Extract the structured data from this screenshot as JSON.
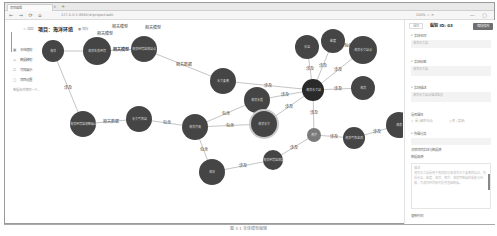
{
  "browser": {
    "tab_label": "项目编辑",
    "tab_close": "×",
    "new_tab": "+",
    "nav_icons": "← → ⟳ ⌂",
    "url": "127.0.0.1:8080/#/project/edit",
    "addr_right": "100%  ☆ ≡",
    "window_icons": "— ▢"
  },
  "header": {
    "back_label": "< 返回",
    "project_title": "项目：海洋环境",
    "badge_label": "● 保存"
  },
  "sidebar": {
    "items": [
      {
        "icon": "▣",
        "label": "本体建模"
      },
      {
        "icon": "⚠",
        "label": "数据映射"
      },
      {
        "icon": "☐",
        "label": "可视展示"
      },
      {
        "icon": "▢",
        "label": "项目设置"
      },
      {
        "icon": "",
        "label": "数据合并等同一个..."
      }
    ]
  },
  "graph": {
    "nodes": [
      {
        "id": "n1",
        "x": 48,
        "y": 31,
        "r": 11,
        "label": "海洋"
      },
      {
        "id": "n2",
        "x": 92,
        "y": 31,
        "r": 14,
        "label": "海洋生态环境"
      },
      {
        "id": "n3",
        "x": 139,
        "y": 29,
        "r": 13,
        "label": "海洋环境监测站点"
      },
      {
        "id": "n4",
        "x": 78,
        "y": 104,
        "r": 13,
        "label": "海洋环境监测数据点"
      },
      {
        "id": "n5",
        "x": 134,
        "y": 99,
        "r": 13,
        "label": "水文气象站"
      },
      {
        "id": "n6",
        "x": 190,
        "y": 107,
        "r": 13,
        "label": "海洋污染"
      },
      {
        "id": "n7",
        "x": 218,
        "y": 61,
        "r": 13,
        "label": "水文要素"
      },
      {
        "id": "n8",
        "x": 252,
        "y": 80,
        "r": 13,
        "label": "海洋水质"
      },
      {
        "id": "n9",
        "x": 259,
        "y": 104,
        "r": 13,
        "label": "海洋水文",
        "highlight": true
      },
      {
        "id": "n10",
        "x": 302,
        "y": 27,
        "r": 12,
        "label": "水温"
      },
      {
        "id": "n11",
        "x": 328,
        "y": 21,
        "r": 12,
        "label": "盐度"
      },
      {
        "id": "n12",
        "x": 308,
        "y": 70,
        "r": 11,
        "label": "海洋水文站"
      },
      {
        "id": "n13",
        "x": 358,
        "y": 30,
        "r": 14,
        "label": "海洋水文站点"
      },
      {
        "id": "n14",
        "x": 358,
        "y": 68,
        "r": 12,
        "label": "海流"
      },
      {
        "id": "n15",
        "x": 309,
        "y": 115,
        "r": 7,
        "label": "潮汐",
        "light": true
      },
      {
        "id": "n16",
        "x": 349,
        "y": 118,
        "r": 11,
        "label": "海洋气象监测"
      },
      {
        "id": "n17",
        "x": 394,
        "y": 105,
        "r": 13,
        "label": "海浪"
      },
      {
        "id": "n18",
        "x": 268,
        "y": 140,
        "r": 10,
        "label": "海洋环境监测站"
      },
      {
        "id": "n19",
        "x": 207,
        "y": 152,
        "r": 13,
        "label": "海冰"
      }
    ],
    "edges": [
      {
        "from": "n1",
        "to": "n2",
        "label": ""
      },
      {
        "from": "n2",
        "to": "n3",
        "label": "相关模型"
      },
      {
        "from": "n2",
        "to": "n3",
        "label": "相关模型"
      },
      {
        "from": "n3",
        "to": "n7",
        "label": "相关数据"
      },
      {
        "from": "n1",
        "to": "n4",
        "label": "涉及"
      },
      {
        "from": "n4",
        "to": "n5",
        "label": "相关数据"
      },
      {
        "from": "n5",
        "to": "n6",
        "label": "包含"
      },
      {
        "from": "n6",
        "to": "n8",
        "label": "包含"
      },
      {
        "from": "n6",
        "to": "n9",
        "label": "包含"
      },
      {
        "from": "n6",
        "to": "n19",
        "label": "包含"
      },
      {
        "from": "n7",
        "to": "n12",
        "label": "涉及"
      },
      {
        "from": "n8",
        "to": "n12",
        "label": "涉及"
      },
      {
        "from": "n9",
        "to": "n12",
        "label": "涉及"
      },
      {
        "from": "n10",
        "to": "n12",
        "label": "涉及"
      },
      {
        "from": "n11",
        "to": "n12",
        "label": "涉及"
      },
      {
        "from": "n11",
        "to": "n13",
        "label": "包含"
      },
      {
        "from": "n13",
        "to": "n12",
        "label": "涉及"
      },
      {
        "from": "n14",
        "to": "n12",
        "label": "涉及"
      },
      {
        "from": "n12",
        "to": "n15",
        "label": "涉及"
      },
      {
        "from": "n15",
        "to": "n16",
        "label": "涉及"
      },
      {
        "from": "n16",
        "to": "n17",
        "label": "涉及"
      },
      {
        "from": "n15",
        "to": "n18",
        "label": "涉及"
      },
      {
        "from": "n18",
        "to": "n19",
        "label": "涉及"
      }
    ],
    "floating_labels": [
      {
        "x": 115,
        "y": 8,
        "text": "相关模型"
      },
      {
        "x": 100,
        "y": 15,
        "text": "相关模型"
      },
      {
        "x": 148,
        "y": 9,
        "text": "相关模型"
      }
    ]
  },
  "panel": {
    "tab_inactive": "属性",
    "tab_active": "编辑 ID: 03",
    "action_button": "保存修改",
    "fields": [
      {
        "label": "* 实体名称",
        "value": "海洋水文站"
      },
      {
        "label": "* 实体标签",
        "value": "海洋水文站"
      },
      {
        "label": "* 实体描述",
        "value": "海洋水文站点描述信息"
      }
    ],
    "radio_label": "是否属性",
    "radio_options": [
      "○ 是 (属性节点)",
      "○ 否 (实体)"
    ],
    "extra_label": "* 所属分类",
    "extra_value": "",
    "link_text": "关联项目实体与数据源",
    "section_label": "数据来源",
    "desc_title": "描述",
    "desc_text": "海洋水文站是用于观测和记录海洋水文要素的站点，包括水温、盐度、海流、潮汐、海浪等数据的采集与传输，为海洋环境研究提供基础数据。",
    "footer_label": "更新时间"
  },
  "caption": "图 3-1  本体模型编辑"
}
